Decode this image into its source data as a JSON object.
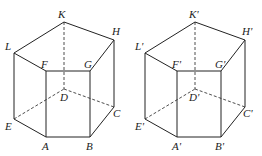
{
  "figures": [
    {
      "name": "prism-left",
      "labels": {
        "K": "K",
        "H": "H",
        "G": "G",
        "F": "F",
        "L": "L",
        "D": "D",
        "C": "C",
        "B": "B",
        "A": "A",
        "E": "E"
      }
    },
    {
      "name": "prism-right",
      "labels": {
        "K": "K'",
        "H": "H'",
        "G": "G'",
        "F": "F'",
        "L": "L'",
        "D": "D'",
        "C": "C'",
        "B": "B'",
        "A": "A'",
        "E": "E'"
      }
    }
  ]
}
